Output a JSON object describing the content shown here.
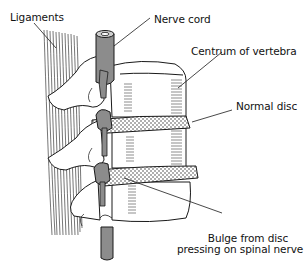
{
  "diagram": {
    "labels": {
      "ligaments": "Ligaments",
      "nerve_cord": "Nerve cord",
      "centrum": "Centrum of vertebra",
      "normal_disc": "Normal disc",
      "bulge_line1": "Bulge from disc",
      "bulge_line2": "pressing on spinal nerve"
    },
    "colors": {
      "outline": "#1a1a1a",
      "nerve_gray": "#8c8c8c",
      "disc_fill": "#ffffff",
      "background": "#ffffff"
    }
  }
}
